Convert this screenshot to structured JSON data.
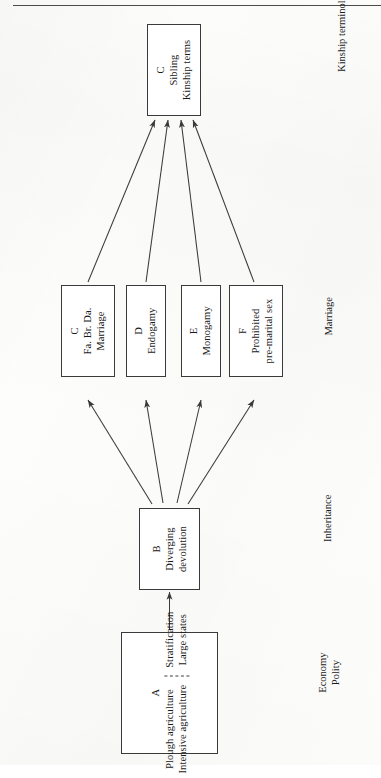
{
  "page": {
    "orientation": "rotated-90-ccw",
    "background_color": "#fdfdfc",
    "ink_color": "#3a3a3a",
    "rule_color": "#4b4b4b"
  },
  "diagram": {
    "title": "",
    "nodes": [
      {
        "id": "C-top",
        "code": "C",
        "lines": [
          "Sibling",
          "Kinship terms"
        ],
        "zone": "Kinship terminology"
      },
      {
        "id": "C-marriage",
        "code": "C",
        "lines": [
          "Fa. Br. Da.",
          "Marriage"
        ],
        "zone": "Marriage"
      },
      {
        "id": "D",
        "code": "D",
        "lines": [
          "Endogamy"
        ],
        "zone": "Marriage"
      },
      {
        "id": "E",
        "code": "E",
        "lines": [
          "Monogamy"
        ],
        "zone": "Marriage"
      },
      {
        "id": "F",
        "code": "F",
        "lines": [
          "Prohibited",
          "pre-marital sex"
        ],
        "zone": "Marriage"
      },
      {
        "id": "B",
        "code": "B",
        "lines": [
          "Diverging",
          "devolution"
        ],
        "zone": "Inheritance"
      },
      {
        "id": "A",
        "code": "A",
        "group_left": [
          "Plough agriculture",
          "Intensive agriculture"
        ],
        "group_right": [
          "Stratification",
          "Large states"
        ],
        "zone": "Economy Polity"
      }
    ],
    "zone_labels": [
      {
        "id": "zone-kinship",
        "lines": [
          "Kinship terminology"
        ]
      },
      {
        "id": "zone-marriage",
        "lines": [
          "Marriage"
        ]
      },
      {
        "id": "zone-inheritance",
        "lines": [
          "Inheritance"
        ]
      },
      {
        "id": "zone-economy",
        "lines": [
          "Economy",
          "Polity"
        ]
      }
    ],
    "edges": [
      {
        "from": "A",
        "to": "B",
        "style": "solid-arrow"
      },
      {
        "from": "B",
        "to": "C-marriage",
        "style": "solid-arrow"
      },
      {
        "from": "B",
        "to": "D",
        "style": "solid-arrow"
      },
      {
        "from": "B",
        "to": "E",
        "style": "solid-arrow"
      },
      {
        "from": "B",
        "to": "F",
        "style": "solid-arrow"
      },
      {
        "from": "C-marriage",
        "to": "C-top",
        "style": "solid-arrow"
      },
      {
        "from": "D",
        "to": "C-top",
        "style": "solid-arrow"
      },
      {
        "from": "E",
        "to": "C-top",
        "style": "solid-arrow"
      },
      {
        "from": "F",
        "to": "C-top",
        "style": "solid-arrow"
      }
    ]
  }
}
